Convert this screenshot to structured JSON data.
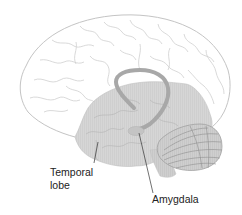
{
  "diagram": {
    "labels": [
      {
        "id": "temporal-lobe",
        "line1": "Temporal",
        "line2": "lobe"
      },
      {
        "id": "amygdala",
        "line1": "Amygdala"
      }
    ],
    "colors": {
      "outline": "#c8c8c8",
      "temporal_fill": "#d4d4d4",
      "hippocampus_arc": "#a8a8a8",
      "amygdala_fill": "#bdbdbd",
      "cerebellum_lines": "#8a8a8a",
      "leader_line": "#333333"
    }
  }
}
